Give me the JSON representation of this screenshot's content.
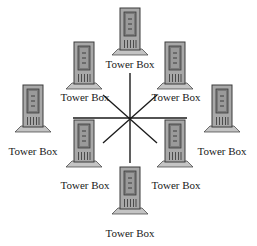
{
  "diagram": {
    "type": "star-network",
    "hub": {
      "x": 130,
      "y": 118
    },
    "spokes": [
      {
        "x1": 73,
        "y1": 118,
        "x2": 187,
        "y2": 118
      },
      {
        "x1": 130,
        "y1": 73,
        "x2": 130,
        "y2": 163
      },
      {
        "x1": 103,
        "y1": 95,
        "x2": 157,
        "y2": 143
      },
      {
        "x1": 157,
        "y1": 95,
        "x2": 103,
        "y2": 143
      }
    ],
    "colors": {
      "line": "#1a1a1a",
      "tower_body": "#a8a8a8",
      "tower_outline": "#3a3a3a",
      "panel": "#7a7a7a",
      "panel_inner": "#9a9a9a",
      "base": "#c4c4c4"
    },
    "nodes": [
      {
        "id": "top",
        "label": "Tower Box",
        "x": 120,
        "y": 8,
        "label_x": 130,
        "label_y": 68
      },
      {
        "id": "upper-left",
        "label": "Tower Box",
        "x": 74,
        "y": 42,
        "label_x": 85,
        "label_y": 101
      },
      {
        "id": "upper-right",
        "label": "Tower Box",
        "x": 165,
        "y": 42,
        "label_x": 176,
        "label_y": 101
      },
      {
        "id": "left",
        "label": "Tower Box",
        "x": 23,
        "y": 85,
        "label_x": 33,
        "label_y": 155
      },
      {
        "id": "right",
        "label": "Tower Box",
        "x": 212,
        "y": 85,
        "label_x": 222,
        "label_y": 155
      },
      {
        "id": "lower-left",
        "label": "Tower Box",
        "x": 74,
        "y": 120,
        "label_x": 85,
        "label_y": 189
      },
      {
        "id": "lower-right",
        "label": "Tower Box",
        "x": 165,
        "y": 120,
        "label_x": 176,
        "label_y": 189
      },
      {
        "id": "bottom",
        "label": "Tower Box",
        "x": 120,
        "y": 167,
        "label_x": 130,
        "label_y": 237
      }
    ]
  }
}
